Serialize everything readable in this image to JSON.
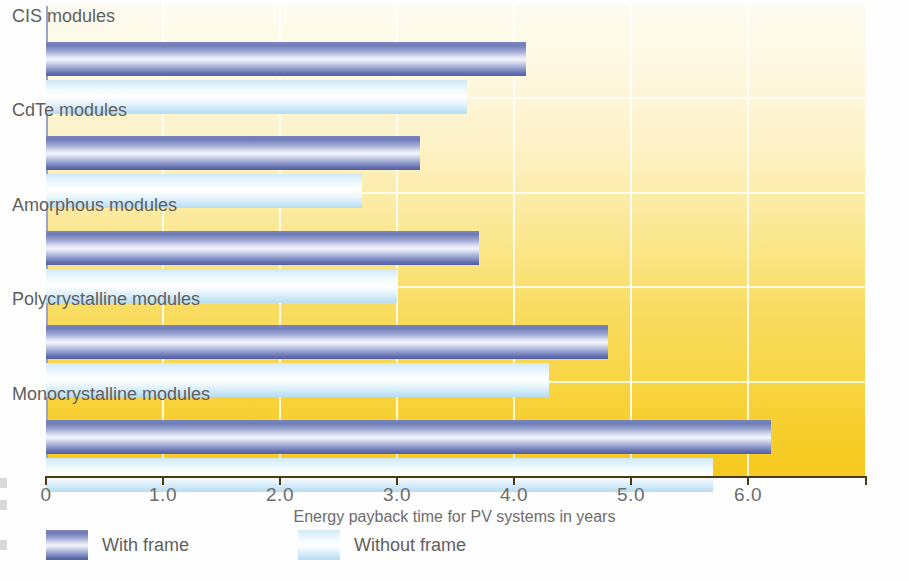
{
  "chart_data": {
    "type": "bar",
    "orientation": "horizontal",
    "title": "",
    "xlabel": "Energy payback time for PV systems in years",
    "ylabel": "",
    "xlim": [
      0,
      7.0
    ],
    "xticks": [
      "0",
      "1.0",
      "2.0",
      "3.0",
      "4.0",
      "5.0",
      "6.0"
    ],
    "xtick_values": [
      0,
      1.0,
      2.0,
      3.0,
      4.0,
      5.0,
      6.0
    ],
    "grid": "vertical-white-lines",
    "legend_position": "below-axis-left",
    "categories": [
      "CIS modules",
      "CdTe modules",
      "Amorphous modules",
      "Polycrystalline modules",
      "Monocrystalline modules"
    ],
    "series": [
      {
        "name": "With frame",
        "color": "#6f7cb8",
        "values": [
          4.1,
          3.2,
          3.7,
          4.8,
          6.2
        ]
      },
      {
        "name": "Without frame",
        "color": "#cfe7f5",
        "values": [
          3.6,
          2.7,
          3.0,
          4.3,
          5.7
        ]
      }
    ]
  },
  "axis": {
    "title": "Energy payback time for PV systems in years"
  },
  "legend": {
    "items": [
      {
        "label": "With frame"
      },
      {
        "label": "Without frame"
      }
    ]
  }
}
